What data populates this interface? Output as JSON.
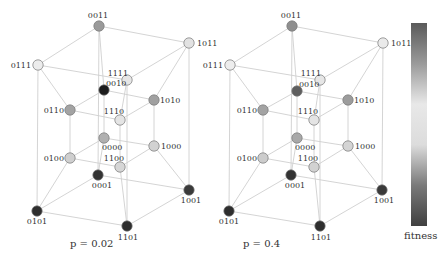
{
  "panels": [
    {
      "caption": "p = 0.02",
      "caption_pos": [
        70,
        247
      ],
      "nodes": [
        {
          "id": "0011",
          "x": 99,
          "y": 26,
          "color": "#9a9a9a",
          "lx": 98,
          "ly": 18,
          "anchor": "middle"
        },
        {
          "id": "1011",
          "x": 189,
          "y": 43,
          "color": "#e2e2e2",
          "lx": 197,
          "ly": 46,
          "anchor": "start"
        },
        {
          "id": "0111",
          "x": 38,
          "y": 65,
          "color": "#ececec",
          "lx": 31,
          "ly": 68,
          "anchor": "end"
        },
        {
          "id": "1111",
          "x": 127,
          "y": 80,
          "color": "#e6e6e6",
          "lx": 128,
          "ly": 76,
          "anchor": "end"
        },
        {
          "id": "0010",
          "x": 104,
          "y": 90,
          "color": "#1c1c1c",
          "lx": 106,
          "ly": 86,
          "anchor": "start"
        },
        {
          "id": "1010",
          "x": 154,
          "y": 100,
          "color": "#a0a0a0",
          "lx": 160,
          "ly": 103,
          "anchor": "start"
        },
        {
          "id": "0110",
          "x": 70,
          "y": 110,
          "color": "#a3a3a3",
          "lx": 64,
          "ly": 113,
          "anchor": "end"
        },
        {
          "id": "1110",
          "x": 120,
          "y": 120,
          "color": "#e4e4e4",
          "lx": 114,
          "ly": 114,
          "anchor": "middle"
        },
        {
          "id": "0000",
          "x": 104,
          "y": 138,
          "color": "#b0b0b0",
          "lx": 102,
          "ly": 150,
          "anchor": "start"
        },
        {
          "id": "1000",
          "x": 154,
          "y": 146,
          "color": "#d2d2d2",
          "lx": 161,
          "ly": 149,
          "anchor": "start"
        },
        {
          "id": "0100",
          "x": 70,
          "y": 158,
          "color": "#cfcfcf",
          "lx": 64,
          "ly": 161,
          "anchor": "end"
        },
        {
          "id": "1100",
          "x": 120,
          "y": 167,
          "color": "#d6d6d6",
          "lx": 114,
          "ly": 161,
          "anchor": "middle"
        },
        {
          "id": "0001",
          "x": 98,
          "y": 175,
          "color": "#333333",
          "lx": 102,
          "ly": 188,
          "anchor": "middle"
        },
        {
          "id": "1001",
          "x": 189,
          "y": 190,
          "color": "#3a3a3a",
          "lx": 191,
          "ly": 203,
          "anchor": "middle"
        },
        {
          "id": "0101",
          "x": 37,
          "y": 211,
          "color": "#2e2e2e",
          "lx": 37,
          "ly": 224,
          "anchor": "middle"
        },
        {
          "id": "1101",
          "x": 127,
          "y": 226,
          "color": "#2e2e2e",
          "lx": 128,
          "ly": 240,
          "anchor": "middle"
        }
      ]
    },
    {
      "caption": "p = 0.4",
      "caption_pos": [
        243,
        247
      ],
      "nodes": [
        {
          "id": "0011",
          "x": 292,
          "y": 26,
          "color": "#8f8f8f",
          "lx": 291,
          "ly": 18,
          "anchor": "middle"
        },
        {
          "id": "1011",
          "x": 383,
          "y": 43,
          "color": "#eaeaea",
          "lx": 391,
          "ly": 46,
          "anchor": "start"
        },
        {
          "id": "0111",
          "x": 230,
          "y": 65,
          "color": "#ededed",
          "lx": 223,
          "ly": 68,
          "anchor": "end"
        },
        {
          "id": "1111",
          "x": 320,
          "y": 80,
          "color": "#e6e6e6",
          "lx": 321,
          "ly": 76,
          "anchor": "end"
        },
        {
          "id": "0010",
          "x": 297,
          "y": 91,
          "color": "#5e5e5e",
          "lx": 299,
          "ly": 87,
          "anchor": "start"
        },
        {
          "id": "1010",
          "x": 348,
          "y": 100,
          "color": "#9c9c9c",
          "lx": 354,
          "ly": 103,
          "anchor": "start"
        },
        {
          "id": "0110",
          "x": 263,
          "y": 110,
          "color": "#a3a3a3",
          "lx": 257,
          "ly": 113,
          "anchor": "end"
        },
        {
          "id": "1110",
          "x": 314,
          "y": 120,
          "color": "#e4e4e4",
          "lx": 308,
          "ly": 114,
          "anchor": "middle"
        },
        {
          "id": "0000",
          "x": 297,
          "y": 138,
          "color": "#a8a8a8",
          "lx": 295,
          "ly": 150,
          "anchor": "start"
        },
        {
          "id": "1000",
          "x": 348,
          "y": 146,
          "color": "#d4d4d4",
          "lx": 355,
          "ly": 149,
          "anchor": "start"
        },
        {
          "id": "0100",
          "x": 263,
          "y": 158,
          "color": "#cccccc",
          "lx": 257,
          "ly": 161,
          "anchor": "end"
        },
        {
          "id": "1100",
          "x": 314,
          "y": 167,
          "color": "#d2d2d2",
          "lx": 308,
          "ly": 161,
          "anchor": "middle"
        },
        {
          "id": "0001",
          "x": 291,
          "y": 175,
          "color": "#333333",
          "lx": 295,
          "ly": 188,
          "anchor": "middle"
        },
        {
          "id": "1001",
          "x": 382,
          "y": 190,
          "color": "#3a3a3a",
          "lx": 384,
          "ly": 203,
          "anchor": "middle"
        },
        {
          "id": "0101",
          "x": 229,
          "y": 211,
          "color": "#2e2e2e",
          "lx": 229,
          "ly": 224,
          "anchor": "middle"
        },
        {
          "id": "1101",
          "x": 320,
          "y": 226,
          "color": "#2e2e2e",
          "lx": 321,
          "ly": 240,
          "anchor": "middle"
        }
      ]
    }
  ],
  "colorbar": {
    "label": "fitness",
    "stops": [
      "#5a5a5a",
      "#9a9a9a",
      "#e8e8e8",
      "#dcdcdc",
      "#7a7a7a",
      "#404040"
    ]
  }
}
